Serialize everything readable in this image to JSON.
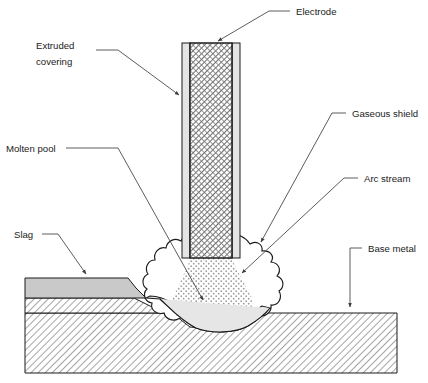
{
  "diagram": {
    "background_color": "#ffffff",
    "width": 428,
    "height": 383,
    "colors": {
      "outline": "#1b1b1b",
      "leader_line": "#4a4a4a",
      "label_text": "#1b1b1b",
      "slag_fill": "#c9c9c9",
      "covering_fill": "#e4e4e4",
      "core_hatch": "#6d6d6d",
      "base_metal_hatch": "#5a5a5a",
      "molten_pool_fill": "#e0e0e0",
      "arc_stream_stipple": "#9a9a9a",
      "gaseous_shield_fill": "#ffffff"
    },
    "labels": [
      {
        "id": "electrode",
        "name": "electrode",
        "text": "Electrode",
        "text_x": 296,
        "text_y": 15,
        "anchor": "start",
        "leader_path": "M 290 11 L 269 11 L 216 42",
        "arrow_at": [
          216,
          42
        ],
        "arrow_angle": 150
      },
      {
        "id": "extruded-covering",
        "name": "extruded-covering",
        "text": "Extruded\ncovering",
        "line1": "Extruded",
        "line2": "covering",
        "text_x": 36,
        "text_y": 49,
        "anchor": "start",
        "leader_path": "M 96 56 L 118 56 L 181 96",
        "arrow_at": [
          181,
          96
        ],
        "arrow_angle": 32
      },
      {
        "id": "gaseous-shield",
        "name": "gaseous-shield",
        "text": "Gaseous shield",
        "text_x": 350,
        "text_y": 117,
        "anchor": "start",
        "leader_path": "M 344 113 L 332 113 L 259 244",
        "arrow_at": [
          259,
          244
        ],
        "arrow_angle": 119
      },
      {
        "id": "arc-stream",
        "name": "arc-stream",
        "text": "Arc stream",
        "text_x": 362,
        "text_y": 182,
        "anchor": "start",
        "leader_path": "M 356 178 L 344 178 L 240 275",
        "arrow_at": [
          240,
          275
        ],
        "arrow_angle": 137
      },
      {
        "id": "molten-pool",
        "name": "molten-pool",
        "text": "Molten pool",
        "text_x": 6,
        "text_y": 152,
        "anchor": "start",
        "leader_path": "M 66 148 L 118 148 L 205 303",
        "arrow_at": [
          205,
          303
        ],
        "arrow_angle": 60
      },
      {
        "id": "slag",
        "name": "slag",
        "text": "Slag",
        "text_x": 14,
        "text_y": 238,
        "anchor": "start",
        "leader_path": "M 42 234 L 58 234 L 88 277",
        "arrow_at": [
          88,
          277
        ],
        "arrow_angle": 55
      },
      {
        "id": "base-metal",
        "name": "base-metal",
        "text": "Base metal",
        "text_x": 368,
        "text_y": 252,
        "anchor": "start",
        "leader_path": "M 362 248 L 350 248 L 350 310",
        "arrow_at": [
          350,
          310
        ],
        "arrow_angle": 90
      }
    ],
    "parts": {
      "electrode": {
        "label": "Electrode",
        "core_x": 190,
        "core_y": 43,
        "core_width": 42,
        "core_height": 215
      },
      "extruded_covering": {
        "label": "Extruded covering",
        "left_strip_x": 182,
        "right_strip_x": 232,
        "strip_width": 8,
        "top_y": 43,
        "bottom_y": 258
      },
      "slag": {
        "label": "Slag",
        "top_y": 278,
        "bottom_y": 298,
        "left_x": 25,
        "right_x": 135
      },
      "weld_bead_layer": {
        "top_y": 298,
        "bottom_y": 313
      },
      "base_metal": {
        "label": "Base metal",
        "left_x": 25,
        "right_x": 397,
        "top_y": 313,
        "bottom_y": 373
      },
      "molten_pool": {
        "label": "Molten pool"
      },
      "arc_stream": {
        "label": "Arc stream"
      },
      "gaseous_shield": {
        "label": "Gaseous shield"
      }
    }
  }
}
